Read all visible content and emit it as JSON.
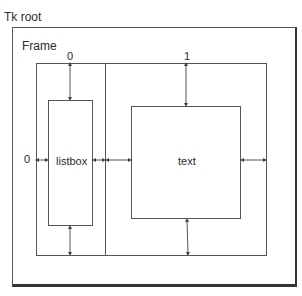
{
  "diagram": {
    "root_label": "Tk root",
    "frame_label": "Frame",
    "column_labels": [
      "0",
      "1"
    ],
    "row_labels": [
      "0"
    ],
    "widgets": [
      {
        "name": "listbox",
        "label": "listbox",
        "row": 0,
        "column": 0
      },
      {
        "name": "text",
        "label": "text",
        "row": 0,
        "column": 1
      }
    ]
  }
}
